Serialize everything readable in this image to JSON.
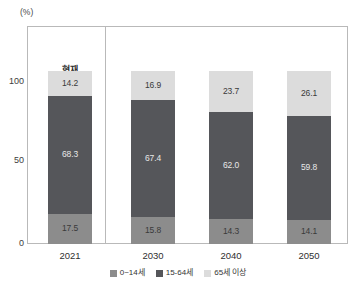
{
  "chart_data": {
    "type": "bar",
    "subtype": "stacked-100-percent",
    "title": "",
    "xlabel": "",
    "ylabel": "",
    "unit_label": "(%)",
    "categories": [
      "2021",
      "2030",
      "2040",
      "2050"
    ],
    "ylim": [
      0,
      100
    ],
    "yticks": [
      "0",
      "50",
      "100"
    ],
    "grid": false,
    "legend_position": "bottom",
    "series": [
      {
        "name": "0~14세",
        "key": "young",
        "color": "#8c8c8c",
        "values": [
          17.5,
          14.3,
          15.8,
          14.1
        ],
        "labels": [
          "17.5",
          "15.8",
          "14.3",
          "14.1"
        ]
      },
      {
        "name": "15-64세",
        "key": "working",
        "color": "#55565a",
        "values": [
          68.3,
          67.4,
          62.0,
          59.8
        ],
        "labels": [
          "68.3",
          "67.4",
          "62.0",
          "59.8"
        ]
      },
      {
        "name": "65세 이상",
        "key": "elderly",
        "color": "#dcdcdc",
        "values": [
          14.2,
          16.9,
          23.7,
          26.1
        ],
        "labels": [
          "14.2",
          "16.9",
          "23.7",
          "26.1"
        ]
      }
    ],
    "annotations": [
      {
        "text": "현재",
        "category": "2021"
      }
    ],
    "stacks": [
      {
        "category": "2021",
        "young": 17.5,
        "working": 68.3,
        "elderly": 14.2,
        "young_label": "17.5",
        "working_label": "68.3",
        "elderly_label": "14.2"
      },
      {
        "category": "2030",
        "young": 15.8,
        "working": 67.4,
        "elderly": 16.9,
        "young_label": "15.8",
        "working_label": "67.4",
        "elderly_label": "16.9"
      },
      {
        "category": "2040",
        "young": 14.3,
        "working": 62.0,
        "elderly": 23.7,
        "young_label": "14.3",
        "working_label": "62.0",
        "elderly_label": "23.7"
      },
      {
        "category": "2050",
        "young": 14.1,
        "working": 59.8,
        "elderly": 26.1,
        "young_label": "14.1",
        "working_label": "59.8",
        "elderly_label": "26.1"
      }
    ]
  },
  "axis": {
    "unit": "(%)",
    "y": {
      "t0": "0",
      "t50": "50",
      "t100": "100"
    },
    "x": {
      "c0": "2021",
      "c1": "2030",
      "c2": "2040",
      "c3": "2050"
    }
  },
  "annotation": {
    "current": "현재"
  },
  "legend": {
    "items": [
      {
        "label": "0~14세",
        "color": "#8c8c8c"
      },
      {
        "label": "15-64세",
        "color": "#55565a"
      },
      {
        "label": "65세 이상",
        "color": "#dcdcdc"
      }
    ]
  },
  "colors": {
    "young": "#8c8c8c",
    "working": "#55565a",
    "elderly": "#dcdcdc",
    "frame": "#b9b9b9",
    "text": "#2f2f2f"
  }
}
